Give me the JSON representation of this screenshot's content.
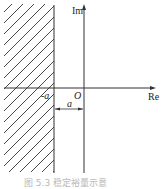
{
  "diagram": {
    "axes": {
      "real_label": "Re",
      "imag_label": "Im",
      "origin_label": "O"
    },
    "boundary_label": "-a",
    "distance_label": "a",
    "caption": "图 5.3  稳定裕量示意",
    "colors": {
      "lines": "#333333",
      "caption": "#b8b8b8"
    }
  }
}
